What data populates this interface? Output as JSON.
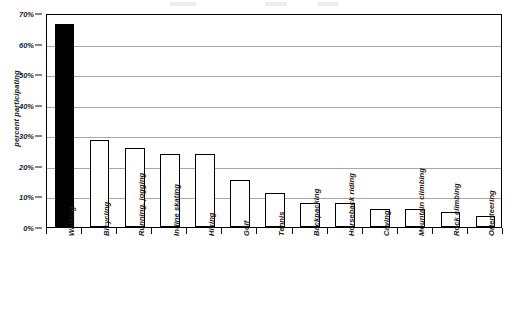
{
  "chart_data": {
    "type": "bar",
    "title": "",
    "xlabel": "",
    "ylabel": "percent participating",
    "ylim": [
      0,
      70
    ],
    "ytick_labels": [
      "0%",
      "10%",
      "20%",
      "30%",
      "40%",
      "50%",
      "60%",
      "70%"
    ],
    "ytick_values": [
      0,
      10,
      20,
      30,
      40,
      50,
      60,
      70
    ],
    "grid": true,
    "legend": "none",
    "categories": [
      "Walking",
      "Bicycling",
      "Running, jogging",
      "In-line skating",
      "Hiking",
      "Golf",
      "Tennis",
      "Backpacking",
      "Horseback riding",
      "Caving",
      "Mountain climbing",
      "Rock climbing",
      "Orienteering"
    ],
    "values": [
      66.5,
      28.5,
      26.0,
      24.0,
      24.0,
      15.5,
      11.0,
      8.0,
      8.0,
      6.0,
      6.0,
      5.0,
      3.5
    ],
    "bar_fill": [
      "solid",
      "open",
      "open",
      "open",
      "open",
      "open",
      "open",
      "open",
      "open",
      "open",
      "open",
      "open",
      "open"
    ],
    "colors": {
      "highlight_bar": "#000000",
      "bar_fill": "#ffffff",
      "bar_outline": "#000000",
      "gridline": "#a8a8a8",
      "axis": "#000000",
      "text": "#1a1a1a",
      "background": "#ffffff"
    }
  }
}
